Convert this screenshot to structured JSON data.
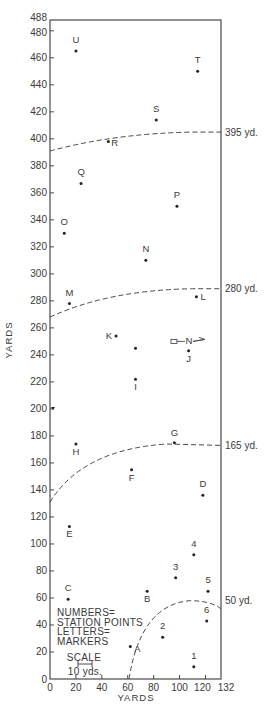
{
  "chart_data": {
    "type": "scatter",
    "title": "",
    "xlabel": "YARDS",
    "ylabel": "YARDS",
    "xlim": [
      0,
      132
    ],
    "ylim": [
      0,
      488
    ],
    "grid": false,
    "x_ticks": [
      0,
      20,
      40,
      60,
      80,
      100,
      120,
      132
    ],
    "y_ticks": [
      0,
      20,
      40,
      60,
      80,
      100,
      120,
      140,
      160,
      180,
      200,
      220,
      240,
      260,
      280,
      300,
      320,
      340,
      360,
      380,
      400,
      420,
      440,
      460,
      480,
      488
    ],
    "markers": [
      {
        "label": "U",
        "x": 20,
        "y": 465
      },
      {
        "label": "T",
        "x": 114,
        "y": 450
      },
      {
        "label": "S",
        "x": 82,
        "y": 414
      },
      {
        "label": "R",
        "x": 45,
        "y": 398
      },
      {
        "label": "Q",
        "x": 24,
        "y": 367
      },
      {
        "label": "P",
        "x": 98,
        "y": 350
      },
      {
        "label": "O",
        "x": 11,
        "y": 330
      },
      {
        "label": "N",
        "x": 74,
        "y": 310
      },
      {
        "label": "L",
        "x": 113,
        "y": 283
      },
      {
        "label": "M",
        "x": 15,
        "y": 278
      },
      {
        "label": "K",
        "x": 51,
        "y": 254
      },
      {
        "label": "",
        "x": 66,
        "y": 245
      },
      {
        "label": "J",
        "x": 107,
        "y": 243
      },
      {
        "label": "I",
        "x": 66,
        "y": 222
      },
      {
        "label": "H",
        "x": 20,
        "y": 174
      },
      {
        "label": "G",
        "x": 96,
        "y": 175
      },
      {
        "label": "F",
        "x": 63,
        "y": 155
      },
      {
        "label": "D",
        "x": 118,
        "y": 136
      },
      {
        "label": "E",
        "x": 15,
        "y": 113
      },
      {
        "label": "C",
        "x": 14,
        "y": 59
      },
      {
        "label": "B",
        "x": 75,
        "y": 65
      },
      {
        "label": "A",
        "x": 62,
        "y": 24
      }
    ],
    "station_points": [
      {
        "label": "1",
        "x": 111,
        "y": 9
      },
      {
        "label": "2",
        "x": 87,
        "y": 31
      },
      {
        "label": "3",
        "x": 97,
        "y": 75
      },
      {
        "label": "4",
        "x": 111,
        "y": 92
      },
      {
        "label": "5",
        "x": 122,
        "y": 65
      },
      {
        "label": "6",
        "x": 121,
        "y": 43
      }
    ],
    "range_arcs": [
      {
        "label": "395 yd.",
        "y_at_right": 405,
        "y_at_left": 391
      },
      {
        "label": "280 yd.",
        "y_at_right": 289,
        "y_at_left": 268
      },
      {
        "label": "165 yd.",
        "y_at_right": 173,
        "y_at_left": 131
      },
      {
        "label": "50 yd.",
        "y_at_right": 58,
        "y_at_left": 0
      }
    ],
    "annotations": {
      "legend_line1": "NUMBERS=",
      "legend_line2": "STATION POINTS",
      "legend_line3": "LETTERS=",
      "legend_line4": "MARKERS",
      "scale_title": "SCALE",
      "scale_value": "10 yds.",
      "north_label": "N"
    },
    "legend_position": "lower-left"
  }
}
